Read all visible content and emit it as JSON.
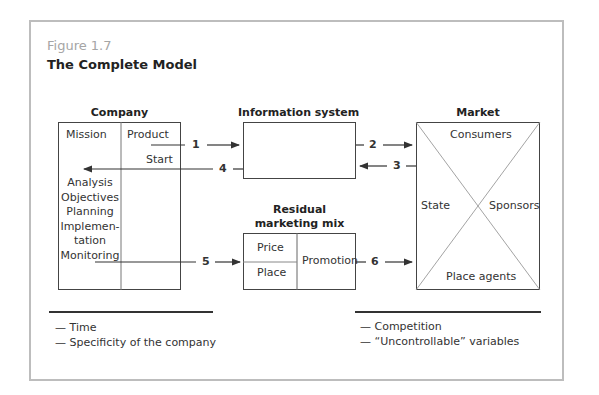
{
  "figure": {
    "number": "Figure 1.7",
    "title": "The Complete Model"
  },
  "company": {
    "header": "Company",
    "left_top": "Mission",
    "right_top": "Product",
    "start": "Start",
    "steps": [
      "Analysis",
      "Objectives",
      "Planning",
      "Implemen-",
      "tation",
      "Monitoring"
    ]
  },
  "information_system": {
    "header": "Information system"
  },
  "market": {
    "header": "Market",
    "top": "Consumers",
    "left": "State",
    "right": "Sponsors",
    "bottom": "Place agents"
  },
  "marketing_mix": {
    "header_line1": "Residual",
    "header_line2": "marketing mix",
    "price": "Price",
    "place": "Place",
    "promotion": "Promotion"
  },
  "arrows": {
    "a1": "1",
    "a2": "2",
    "a3": "3",
    "a4": "4",
    "a5": "5",
    "a6": "6"
  },
  "legend": {
    "left": [
      "— Time",
      "— Specificity of the company"
    ],
    "right": [
      "— Competition",
      "— “Uncontrollable” variables"
    ]
  }
}
